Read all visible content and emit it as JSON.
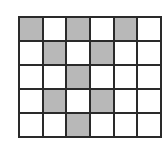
{
  "diagram": {
    "type": "grid",
    "rows": 5,
    "cols": 6,
    "shaded_color": "#b8b8b8",
    "line_color": "#2a2a2a",
    "cells": [
      [
        1,
        0,
        1,
        0,
        1,
        0
      ],
      [
        0,
        1,
        0,
        1,
        0,
        0
      ],
      [
        0,
        0,
        1,
        0,
        0,
        0
      ],
      [
        0,
        1,
        0,
        1,
        0,
        0
      ],
      [
        0,
        0,
        1,
        0,
        0,
        0
      ]
    ]
  }
}
